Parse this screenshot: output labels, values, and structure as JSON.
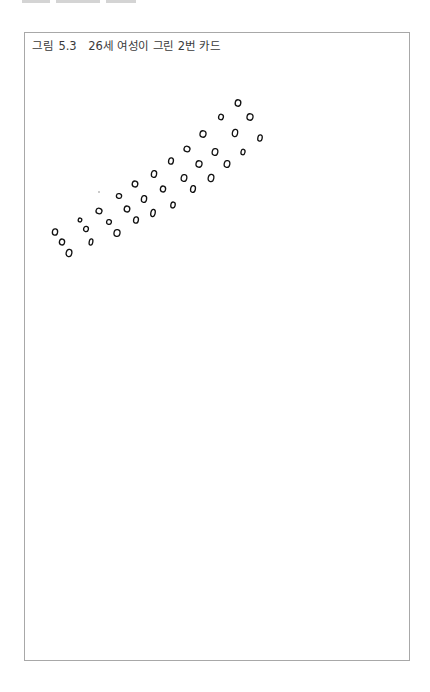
{
  "figure": {
    "label": "그림",
    "number": "5.3",
    "title": "26세 여성이 그린 2번 카드"
  },
  "drawing": {
    "stroke_color": "#111111",
    "circles": [
      {
        "x": 55,
        "y": 232,
        "rx": 2.6,
        "ry": 3.2
      },
      {
        "x": 62,
        "y": 242,
        "rx": 2.6,
        "ry": 3.0
      },
      {
        "x": 69,
        "y": 253,
        "rx": 2.8,
        "ry": 3.6
      },
      {
        "x": 80,
        "y": 220,
        "rx": 1.8,
        "ry": 2.0
      },
      {
        "x": 86,
        "y": 229,
        "rx": 2.4,
        "ry": 2.6
      },
      {
        "x": 91,
        "y": 242,
        "rx": 1.8,
        "ry": 3.2
      },
      {
        "x": 99,
        "y": 211,
        "rx": 3.0,
        "ry": 2.8
      },
      {
        "x": 109,
        "y": 222,
        "rx": 2.4,
        "ry": 2.4
      },
      {
        "x": 117,
        "y": 233,
        "rx": 3.0,
        "ry": 3.4
      },
      {
        "x": 119,
        "y": 196,
        "rx": 2.6,
        "ry": 2.4
      },
      {
        "x": 127,
        "y": 209,
        "rx": 2.8,
        "ry": 3.0
      },
      {
        "x": 136,
        "y": 220,
        "rx": 2.4,
        "ry": 3.2
      },
      {
        "x": 135,
        "y": 184,
        "rx": 2.8,
        "ry": 3.0
      },
      {
        "x": 144,
        "y": 199,
        "rx": 2.6,
        "ry": 3.4
      },
      {
        "x": 153,
        "y": 213,
        "rx": 2.2,
        "ry": 3.6
      },
      {
        "x": 143,
        "y": 199,
        "rx": 0,
        "ry": 0
      },
      {
        "x": 154,
        "y": 174,
        "rx": 2.6,
        "ry": 3.4
      },
      {
        "x": 163,
        "y": 189,
        "rx": 2.6,
        "ry": 3.0
      },
      {
        "x": 173,
        "y": 205,
        "rx": 2.2,
        "ry": 3.0
      },
      {
        "x": 171,
        "y": 161,
        "rx": 2.4,
        "ry": 3.2
      },
      {
        "x": 184,
        "y": 178,
        "rx": 2.8,
        "ry": 3.4
      },
      {
        "x": 193,
        "y": 189,
        "rx": 2.4,
        "ry": 3.4
      },
      {
        "x": 187,
        "y": 149,
        "rx": 3.0,
        "ry": 2.8
      },
      {
        "x": 199,
        "y": 164,
        "rx": 3.0,
        "ry": 3.2
      },
      {
        "x": 211,
        "y": 178,
        "rx": 2.8,
        "ry": 3.6
      },
      {
        "x": 203,
        "y": 134,
        "rx": 3.0,
        "ry": 3.2
      },
      {
        "x": 215,
        "y": 152,
        "rx": 2.8,
        "ry": 3.4
      },
      {
        "x": 227,
        "y": 164,
        "rx": 2.8,
        "ry": 3.4
      },
      {
        "x": 221,
        "y": 117,
        "rx": 2.4,
        "ry": 2.8
      },
      {
        "x": 235,
        "y": 133,
        "rx": 2.6,
        "ry": 3.6
      },
      {
        "x": 243,
        "y": 152,
        "rx": 2.0,
        "ry": 2.8
      },
      {
        "x": 238,
        "y": 103,
        "rx": 2.8,
        "ry": 3.2
      },
      {
        "x": 250,
        "y": 117,
        "rx": 3.0,
        "ry": 3.2
      },
      {
        "x": 260,
        "y": 138,
        "rx": 2.2,
        "ry": 3.2
      }
    ],
    "dots": [
      {
        "x": 99,
        "y": 192,
        "r": 0.8
      }
    ]
  }
}
